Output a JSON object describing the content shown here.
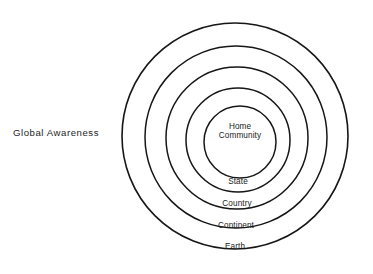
{
  "canvas": {
    "width": 373,
    "height": 274,
    "background_color": "#ffffff",
    "stroke_color": "#161616"
  },
  "side_label": {
    "text": "Global  Awareness",
    "x": 56,
    "y": 133
  },
  "chart_data": {
    "type": "diagram",
    "subtype": "concentric-circles",
    "title": "Global Awareness",
    "center": {
      "x": 236,
      "y": 136
    },
    "rings": [
      {
        "label": "Home\nCommunity",
        "line1": "Home",
        "line2": "Community",
        "level": 1,
        "radius": 36,
        "cx": 240,
        "cy": 142,
        "stroke_width": 1.5,
        "label_x": 240,
        "label_y": 122
      },
      {
        "label": "State",
        "level": 2,
        "radius": 52,
        "cx": 238,
        "cy": 140,
        "stroke_width": 1.5,
        "label_x": 238,
        "label_y": 177
      },
      {
        "label": "Country",
        "level": 3,
        "radius": 71,
        "cx": 237,
        "cy": 138,
        "stroke_width": 1.5,
        "label_x": 237,
        "label_y": 199
      },
      {
        "label": "Continent",
        "level": 4,
        "radius": 91,
        "cx": 236,
        "cy": 137,
        "stroke_width": 1.5,
        "label_x": 236,
        "label_y": 221
      },
      {
        "label": "Earth",
        "level": 5,
        "radius": 113,
        "cx": 235,
        "cy": 136,
        "stroke_width": 1.6,
        "label_x": 235,
        "label_y": 242
      }
    ],
    "ylabel": "",
    "xlabel": "",
    "legend": "none",
    "grid": false
  }
}
